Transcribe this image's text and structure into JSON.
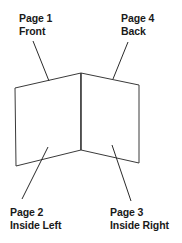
{
  "diagram": {
    "shape": "folded-card-v-shape",
    "stroke_color": "#3a3a3a",
    "text_color": "#1a1a1a",
    "background_color": "#ffffff",
    "labels": [
      {
        "id": "page1",
        "page": "Page 1",
        "position": "Front",
        "corner": "top-left"
      },
      {
        "id": "page4",
        "page": "Page 4",
        "position": "Back",
        "corner": "top-right"
      },
      {
        "id": "page2",
        "page": "Page 2",
        "position": "Inside Left",
        "corner": "bottom-left"
      },
      {
        "id": "page3",
        "page": "Page 3",
        "position": "Inside Right",
        "corner": "bottom-right"
      }
    ]
  }
}
